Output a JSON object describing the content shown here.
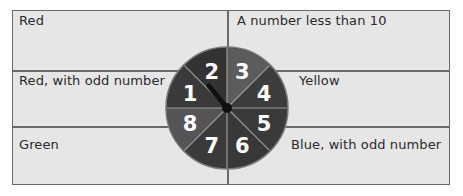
{
  "outcomes": {
    "top_left": "Red",
    "top_right": "A number less than 10",
    "middle_left": "Red, with odd number",
    "middle_right": "Yellow",
    "bottom_left": "Green",
    "bottom_right": "Blue, with odd number"
  },
  "spinner": {
    "sectors": [
      {
        "number": "1",
        "color": "#3a3a3a"
      },
      {
        "number": "2",
        "color": "#333333"
      },
      {
        "number": "3",
        "color": "#5c5c5c"
      },
      {
        "number": "4",
        "color": "#3c3c3c"
      },
      {
        "number": "5",
        "color": "#3a3a3a"
      },
      {
        "number": "6",
        "color": "#383838"
      },
      {
        "number": "7",
        "color": "#3a3a3a"
      },
      {
        "number": "8",
        "color": "#555555"
      }
    ],
    "divider_color": "#9a9a9a",
    "center_color": "#111111"
  },
  "colors": {
    "cell_background": "#e6e6e6",
    "grid_line": "#6a6a6a",
    "text": "#2a2a2a"
  }
}
